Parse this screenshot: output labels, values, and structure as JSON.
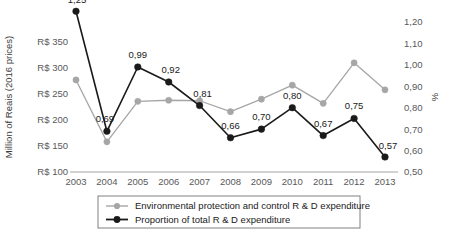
{
  "chart_data": {
    "type": "line",
    "title": "",
    "x": [
      2003,
      2004,
      2005,
      2006,
      2007,
      2008,
      2009,
      2010,
      2011,
      2012,
      2013
    ],
    "categories": [
      "2003",
      "2004",
      "2005",
      "2006",
      "2007",
      "2008",
      "2009",
      "2010",
      "2011",
      "2012",
      "2013"
    ],
    "series": [
      {
        "name": "Environmental protection and control R & D expenditure",
        "axis": "left",
        "color": "#a6a6a6",
        "marker": "circle",
        "values": [
          277,
          158,
          236,
          238,
          237,
          216,
          240,
          267,
          232,
          310,
          258
        ],
        "data_labels": []
      },
      {
        "name": "Proportion of total R & D expenditure",
        "axis": "right",
        "color": "#1a1a1a",
        "marker": "circle",
        "values": [
          1.25,
          0.69,
          0.99,
          0.92,
          0.81,
          0.66,
          0.7,
          0.8,
          0.67,
          0.75,
          0.57
        ],
        "data_labels": [
          "1,25",
          "0,69",
          "0,99",
          "0,92",
          "0,81",
          "0,66",
          "0,70",
          "0,80",
          "0,67",
          "0,75",
          "0,57"
        ]
      }
    ],
    "left_axis": {
      "label": "Million of Reais (2016 prices)",
      "ticks": [
        "R$ 100",
        "R$ 150",
        "R$ 200",
        "R$ 250",
        "R$ 300",
        "R$ 350"
      ],
      "tick_values": [
        100,
        150,
        200,
        250,
        300,
        350
      ],
      "ylim": [
        100,
        350
      ]
    },
    "right_axis": {
      "label": "%",
      "ticks": [
        "0,50",
        "0,60",
        "0,70",
        "0,80",
        "0,90",
        "1,00",
        "1,10",
        "1,20"
      ],
      "tick_values": [
        0.5,
        0.6,
        0.7,
        0.8,
        0.9,
        1.0,
        1.1,
        1.2
      ],
      "ylim": [
        0.5,
        1.2
      ]
    },
    "xlabel": "",
    "grid": false,
    "legend_position": "bottom"
  },
  "legend": {
    "items": [
      {
        "label": "Environmental protection and control R & D expenditure",
        "color": "#a6a6a6"
      },
      {
        "label": "Proportion of total R & D expenditure",
        "color": "#1a1a1a"
      }
    ]
  }
}
